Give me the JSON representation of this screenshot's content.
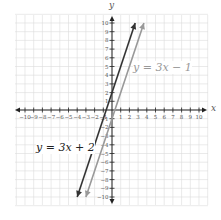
{
  "chart_data": {
    "type": "line",
    "title": "",
    "xlabel": "x",
    "ylabel": "y",
    "xlim": [
      -10,
      10
    ],
    "ylim": [
      -10,
      10
    ],
    "grid": true,
    "x_ticks": [
      -10,
      -9,
      -8,
      -7,
      -6,
      -5,
      -4,
      -3,
      -2,
      -1,
      1,
      2,
      3,
      4,
      5,
      6,
      7,
      8,
      9,
      10
    ],
    "y_ticks": [
      -10,
      -9,
      -8,
      -7,
      -6,
      -5,
      -4,
      -3,
      -2,
      -1,
      1,
      2,
      3,
      4,
      5,
      6,
      7,
      8,
      9,
      10
    ],
    "series": [
      {
        "name": "y = 3x + 2",
        "slope": 3,
        "intercept": 2,
        "color": "#333333",
        "x": [
          -4,
          2.667
        ],
        "y": [
          -10,
          10
        ]
      },
      {
        "name": "y = 3x − 1",
        "slope": 3,
        "intercept": -1,
        "color": "#999999",
        "x": [
          -3,
          3.667
        ],
        "y": [
          -10,
          10
        ]
      }
    ],
    "annotations": [
      {
        "text": "y = 3x − 1",
        "near": "upper right of lines"
      },
      {
        "text": "y = 3x + 2",
        "near": "lower left of lines"
      }
    ]
  },
  "labels": {
    "x_axis": "x",
    "y_axis": "y",
    "line1": "y = 3x − 1",
    "line2": "y = 3x + 2"
  }
}
